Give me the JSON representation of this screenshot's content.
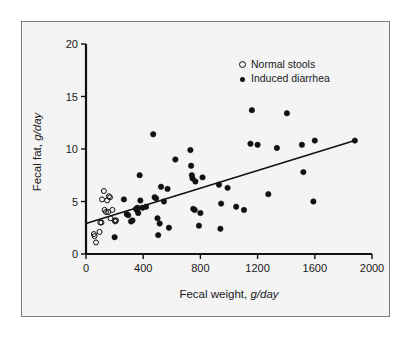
{
  "figure": {
    "background_color": "#f4f4f4",
    "frame_color": "#7d7d7d",
    "ink_color": "#111111"
  },
  "chart_data": {
    "type": "scatter",
    "title": "",
    "xlabel_text": "Fecal weight, ",
    "xlabel_unit": "g/day",
    "ylabel_text": "Fecal fat, ",
    "ylabel_unit": "g/day",
    "xlim": [
      0,
      2000
    ],
    "ylim": [
      0,
      20
    ],
    "xticks": [
      0,
      400,
      800,
      1200,
      1600,
      2000
    ],
    "yticks": [
      0,
      5,
      10,
      15,
      20
    ],
    "xtick_labels": [
      "0",
      "400",
      "800",
      "1200",
      "1600",
      "2000"
    ],
    "ytick_labels": [
      "0",
      "5",
      "10",
      "15",
      "20"
    ],
    "grid": false,
    "legend_position": "top-right",
    "legend": [
      {
        "label": "Normal stools",
        "marker": "open-circle"
      },
      {
        "label": "Induced diarrhea",
        "marker": "filled-circle"
      }
    ],
    "series": [
      {
        "name": "Normal stools",
        "marker": "open-circle",
        "points": [
          [
            55,
            1.9
          ],
          [
            60,
            1.7
          ],
          [
            70,
            1.1
          ],
          [
            95,
            2.1
          ],
          [
            100,
            3.0
          ],
          [
            108,
            3.0
          ],
          [
            112,
            5.2
          ],
          [
            125,
            6.0
          ],
          [
            130,
            4.2
          ],
          [
            140,
            4.0
          ],
          [
            148,
            5.1
          ],
          [
            155,
            4.0
          ],
          [
            160,
            5.5
          ],
          [
            168,
            5.4
          ],
          [
            172,
            3.4
          ],
          [
            185,
            4.2
          ],
          [
            200,
            3.2
          ],
          [
            205,
            3.1
          ],
          [
            210,
            3.2
          ]
        ]
      },
      {
        "name": "Induced diarrhea",
        "marker": "filled-circle",
        "points": [
          [
            200,
            1.6
          ],
          [
            265,
            5.2
          ],
          [
            285,
            3.8
          ],
          [
            295,
            3.7
          ],
          [
            315,
            3.1
          ],
          [
            325,
            3.2
          ],
          [
            350,
            4.3
          ],
          [
            355,
            4.2
          ],
          [
            360,
            4.4
          ],
          [
            365,
            3.9
          ],
          [
            375,
            7.5
          ],
          [
            380,
            5.1
          ],
          [
            395,
            4.4
          ],
          [
            420,
            4.5
          ],
          [
            470,
            11.4
          ],
          [
            480,
            5.4
          ],
          [
            490,
            5.3
          ],
          [
            500,
            3.4
          ],
          [
            505,
            1.8
          ],
          [
            515,
            2.9
          ],
          [
            525,
            6.4
          ],
          [
            545,
            5.0
          ],
          [
            570,
            6.2
          ],
          [
            580,
            2.5
          ],
          [
            625,
            9.0
          ],
          [
            730,
            9.9
          ],
          [
            735,
            8.4
          ],
          [
            740,
            7.5
          ],
          [
            745,
            7.2
          ],
          [
            750,
            4.3
          ],
          [
            760,
            4.2
          ],
          [
            765,
            6.9
          ],
          [
            790,
            2.7
          ],
          [
            800,
            3.9
          ],
          [
            815,
            7.3
          ],
          [
            930,
            6.6
          ],
          [
            940,
            2.4
          ],
          [
            945,
            4.8
          ],
          [
            990,
            6.3
          ],
          [
            1050,
            4.5
          ],
          [
            1105,
            4.2
          ],
          [
            1150,
            10.5
          ],
          [
            1160,
            13.7
          ],
          [
            1200,
            10.4
          ],
          [
            1275,
            5.7
          ],
          [
            1335,
            10.1
          ],
          [
            1405,
            13.4
          ],
          [
            1510,
            10.4
          ],
          [
            1520,
            7.8
          ],
          [
            1590,
            5.0
          ],
          [
            1600,
            10.8
          ],
          [
            1880,
            10.8
          ]
        ]
      }
    ],
    "regression_line": {
      "x_start": 0,
      "y_start": 2.9,
      "x_end": 1880,
      "y_end": 10.8
    }
  }
}
